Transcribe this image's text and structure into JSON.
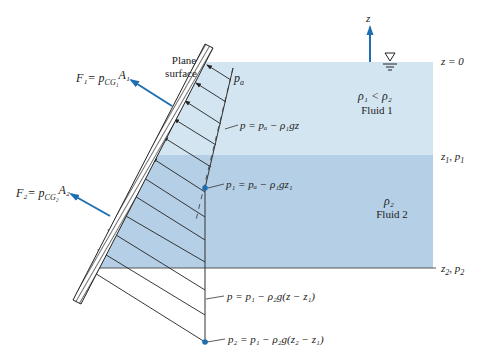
{
  "figure": {
    "type": "Hydrostatic pressure on an inclined plane surface through two stratified fluid layers",
    "colors": {
      "fluid1": "#d3e5f1",
      "fluid2": "#b5d0e6",
      "arrow_blue": "#1f6fb0",
      "line": "#333333",
      "point": "#1f6fb0"
    }
  },
  "labels": {
    "plane_surface_line1": "Plane",
    "plane_surface_line2": "surface",
    "pa": "p",
    "pa_sub": "a",
    "z_axis": "z",
    "z0": "z = 0",
    "z1p1": "z",
    "z1p1_sub": "1",
    "z1p1_rest": ", p",
    "z1p1_sub2": "1",
    "z2p2": "z",
    "z2p2_sub": "2",
    "z2p2_rest": ", p",
    "z2p2_sub2": "2",
    "rho_compare": "ρ₁ < ρ₂",
    "fluid1": "Fluid 1",
    "rho2": "ρ₂",
    "fluid2": "Fluid 2",
    "eq_layer1": "p = pₐ − ρ₁gz",
    "eq_p1": "p₁ = pₐ − ρ₁gz₁",
    "eq_layer2": "p = p₁ − ρ₂g(z − z₁)",
    "eq_p2": "p₂ = p₁ − ρ₂g(z₂ − z₁)",
    "F1": "F₁= p",
    "F1_sub": "CG₁",
    "F1_A": "A₁",
    "F2": "F₂= p",
    "F2_sub": "CG₂",
    "F2_A": "A₂"
  }
}
